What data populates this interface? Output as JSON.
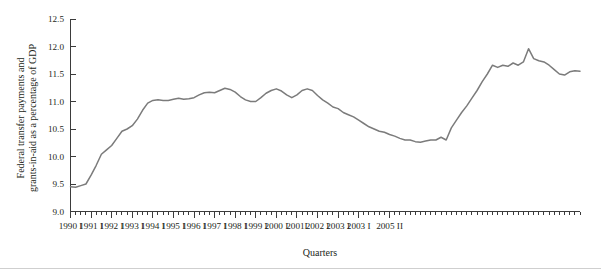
{
  "chart_data": {
    "type": "line",
    "title": "",
    "subtitle": "",
    "xlabel": "Quarters",
    "ylabel": "Federal transfer payments and grants-in-aid as a percentage of GDP",
    "ylabel_line1": "Federal transfer payments and",
    "ylabel_line2": "grants-in-aid as a percentage of GDP",
    "ylim": [
      9.0,
      12.5
    ],
    "ytick_values": [
      9.0,
      9.5,
      10.0,
      10.5,
      11.0,
      11.5,
      12.0,
      12.5
    ],
    "ytick_labels": [
      "9.0",
      "9.5",
      "10.0",
      "10.5",
      "11.0",
      "11.5",
      "12.0",
      "12.5"
    ],
    "xtick_labels": [
      "1990 I",
      "1991 I",
      "1992 I",
      "1993 I",
      "1994 I",
      "1995 I",
      "1996 I",
      "1997 I",
      "1998 I",
      "1999 I",
      "2000 I",
      "2001I",
      "2002 I",
      "2003 I",
      "2003 I",
      "2005 II"
    ],
    "xtick_major_indices": [
      0,
      4,
      8,
      12,
      16,
      20,
      24,
      28,
      32,
      36,
      40,
      44,
      48,
      52,
      56,
      62
    ],
    "minor_ticks": true,
    "grid": false,
    "legend": false,
    "legend_position": "none",
    "line_color": "#7b7b7b",
    "axis_color": "#3b3b3b",
    "x": [
      "1990 I",
      "1990 II",
      "1990 III",
      "1990 IV",
      "1991 I",
      "1991 II",
      "1991 III",
      "1991 IV",
      "1992 I",
      "1992 II",
      "1992 III",
      "1992 IV",
      "1993 I",
      "1993 II",
      "1993 III",
      "1993 IV",
      "1994 I",
      "1994 II",
      "1994 III",
      "1994 IV",
      "1995 I",
      "1995 II",
      "1995 III",
      "1995 IV",
      "1996 I",
      "1996 II",
      "1996 III",
      "1996 IV",
      "1997 I",
      "1997 II",
      "1997 III",
      "1997 IV",
      "1998 I",
      "1998 II",
      "1998 III",
      "1998 IV",
      "1999 I",
      "1999 II",
      "1999 III",
      "1999 IV",
      "2000 I",
      "2000 II",
      "2000 III",
      "2000 IV",
      "2001 I",
      "2001 II",
      "2001 III",
      "2001 IV",
      "2002 I",
      "2002 II",
      "2002 III",
      "2002 IV",
      "2003 I",
      "2003 II",
      "2003 III",
      "2003 IV",
      "2004 I",
      "2004 II",
      "2004 III",
      "2004 IV",
      "2005 I",
      "2005 II"
    ],
    "values": [
      9.45,
      9.44,
      9.48,
      9.5,
      9.62,
      9.8,
      10.02,
      10.12,
      10.18,
      10.3,
      10.45,
      10.5,
      10.52,
      10.62,
      10.78,
      10.93,
      11.02,
      11.04,
      11.03,
      11.03,
      11.05,
      11.07,
      11.05,
      11.06,
      11.08,
      11.12,
      11.16,
      11.17,
      11.17,
      11.2,
      11.24,
      11.22,
      11.18,
      11.1,
      11.04,
      11.0,
      11.0,
      11.06,
      11.14,
      11.2,
      11.23,
      11.2,
      11.13,
      11.08,
      11.12,
      11.2,
      11.23,
      11.2,
      11.12,
      11.04,
      10.98,
      10.9,
      10.88,
      10.8,
      10.76,
      10.72,
      10.68,
      10.62,
      10.56,
      10.5,
      10.46,
      10.44
    ],
    "series": [
      {
        "name": "Federal transfer payments and grants-in-aid as a percentage of GDP",
        "color": "#7b7b7b",
        "points": [
          [
            0,
            9.45
          ],
          [
            1,
            9.44
          ],
          [
            2,
            9.47
          ],
          [
            3,
            9.5
          ],
          [
            4,
            9.66
          ],
          [
            5,
            9.84
          ],
          [
            6,
            10.04
          ],
          [
            7,
            10.12
          ],
          [
            8,
            10.2
          ],
          [
            9,
            10.33
          ],
          [
            10,
            10.46
          ],
          [
            11,
            10.5
          ],
          [
            12,
            10.56
          ],
          [
            13,
            10.68
          ],
          [
            14,
            10.84
          ],
          [
            15,
            10.97
          ],
          [
            16,
            11.02
          ],
          [
            17,
            11.03
          ],
          [
            18,
            11.02
          ],
          [
            19,
            11.02
          ],
          [
            20,
            11.04
          ],
          [
            21,
            11.06
          ],
          [
            22,
            11.04
          ],
          [
            23,
            11.05
          ],
          [
            24,
            11.07
          ],
          [
            25,
            11.12
          ],
          [
            26,
            11.16
          ],
          [
            27,
            11.17
          ],
          [
            28,
            11.16
          ],
          [
            29,
            11.2
          ],
          [
            30,
            11.24
          ],
          [
            31,
            11.22
          ],
          [
            32,
            11.17
          ],
          [
            33,
            11.09
          ],
          [
            34,
            11.03
          ],
          [
            35,
            11.0
          ],
          [
            36,
            11.0
          ],
          [
            37,
            11.07
          ],
          [
            38,
            11.15
          ],
          [
            39,
            11.2
          ],
          [
            40,
            11.23
          ],
          [
            41,
            11.19
          ],
          [
            42,
            11.12
          ],
          [
            43,
            11.07
          ],
          [
            44,
            11.12
          ],
          [
            45,
            11.2
          ],
          [
            46,
            11.23
          ],
          [
            47,
            11.2
          ],
          [
            48,
            11.11
          ],
          [
            49,
            11.03
          ],
          [
            50,
            10.97
          ],
          [
            51,
            10.9
          ],
          [
            52,
            10.87
          ],
          [
            53,
            10.8
          ],
          [
            54,
            10.76
          ],
          [
            55,
            10.72
          ],
          [
            56,
            10.66
          ],
          [
            57,
            10.6
          ],
          [
            58,
            10.54
          ],
          [
            59,
            10.5
          ],
          [
            60,
            10.46
          ],
          [
            61,
            10.44
          ],
          [
            62,
            10.4
          ],
          [
            63,
            10.37
          ],
          [
            64,
            10.33
          ],
          [
            65,
            10.3
          ],
          [
            66,
            10.3
          ],
          [
            67,
            10.27
          ],
          [
            68,
            10.26
          ],
          [
            69,
            10.28
          ],
          [
            70,
            10.3
          ],
          [
            71,
            10.3
          ],
          [
            72,
            10.35
          ],
          [
            73,
            10.3
          ],
          [
            74,
            10.52
          ],
          [
            75,
            10.66
          ],
          [
            76,
            10.8
          ],
          [
            77,
            10.92
          ],
          [
            78,
            11.06
          ],
          [
            79,
            11.2
          ],
          [
            80,
            11.36
          ],
          [
            81,
            11.5
          ],
          [
            82,
            11.66
          ],
          [
            83,
            11.62
          ],
          [
            84,
            11.66
          ],
          [
            85,
            11.64
          ],
          [
            86,
            11.7
          ],
          [
            87,
            11.66
          ],
          [
            88,
            11.72
          ],
          [
            89,
            11.96
          ],
          [
            90,
            11.78
          ],
          [
            91,
            11.74
          ],
          [
            92,
            11.72
          ],
          [
            93,
            11.66
          ],
          [
            94,
            11.58
          ],
          [
            95,
            11.5
          ],
          [
            96,
            11.48
          ],
          [
            97,
            11.54
          ],
          [
            98,
            11.56
          ],
          [
            99,
            11.55
          ]
        ],
        "annotations": []
      }
    ]
  },
  "figure": {
    "x_axis_title": "Quarters",
    "y_axis_title_line1": "Federal transfer payments and",
    "y_axis_title_line2": "grants-in-aid as a percentage of GDP"
  }
}
